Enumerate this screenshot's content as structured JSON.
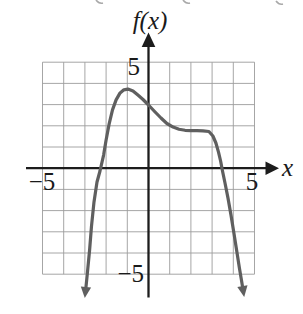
{
  "figure": {
    "function_label": "f(x)",
    "x_axis_label": "x",
    "ticks": {
      "y_top": "5",
      "y_bottom": "−5",
      "x_left": "−5",
      "x_right": "5"
    }
  },
  "colors": {
    "background": "#ffffff",
    "grid": "#9c9c9c",
    "axis": "#1c1c1c",
    "curve": "#5f5f5f",
    "text": "#1a1a1a",
    "fragment": "#a9a9a9"
  },
  "chart_data": {
    "type": "line",
    "title": "f(x)",
    "xlabel": "x",
    "ylabel": "f(x)",
    "xlim": [
      -5,
      5
    ],
    "ylim": [
      -5,
      5
    ],
    "grid": true,
    "grid_step": 1,
    "labeled_ticks": {
      "x": [
        -5,
        5
      ],
      "y": [
        -5,
        5
      ]
    },
    "series": [
      {
        "name": "f(x)",
        "end_arrows": "both curve ends have downward arrowheads below the grid",
        "points": [
          [
            -2.95,
            -5.6
          ],
          [
            -2.88,
            -4.94
          ],
          [
            -2.78,
            -3.86
          ],
          [
            -2.69,
            -2.73
          ],
          [
            -2.57,
            -1.59
          ],
          [
            -2.43,
            -0.65
          ],
          [
            -2.29,
            -0.13
          ],
          [
            -2.12,
            0.62
          ],
          [
            -2.0,
            1.33
          ],
          [
            -1.86,
            2.08
          ],
          [
            -1.7,
            2.75
          ],
          [
            -1.53,
            3.22
          ],
          [
            -1.34,
            3.55
          ],
          [
            -1.16,
            3.7
          ],
          [
            -0.97,
            3.73
          ],
          [
            -0.73,
            3.64
          ],
          [
            -0.5,
            3.45
          ],
          [
            -0.26,
            3.24
          ],
          [
            0.0,
            2.98
          ],
          [
            0.31,
            2.65
          ],
          [
            0.59,
            2.37
          ],
          [
            0.87,
            2.11
          ],
          [
            1.16,
            1.94
          ],
          [
            1.44,
            1.84
          ],
          [
            1.72,
            1.79
          ],
          [
            2.0,
            1.77
          ],
          [
            2.29,
            1.77
          ],
          [
            2.57,
            1.76
          ],
          [
            2.85,
            1.73
          ],
          [
            3.04,
            1.52
          ],
          [
            3.18,
            1.19
          ],
          [
            3.3,
            0.76
          ],
          [
            3.4,
            0.34
          ],
          [
            3.49,
            -0.13
          ],
          [
            3.61,
            -0.7
          ],
          [
            3.75,
            -1.41
          ],
          [
            3.89,
            -2.21
          ],
          [
            4.03,
            -3.06
          ],
          [
            4.17,
            -3.95
          ],
          [
            4.29,
            -4.71
          ],
          [
            4.39,
            -5.32
          ],
          [
            4.43,
            -5.56
          ]
        ]
      }
    ],
    "features": {
      "local_maximum": [
        -1,
        3.7
      ],
      "y_intercept": [
        0,
        3.0
      ],
      "x_intercepts": [
        -2.3,
        3.45
      ],
      "terrace_plateau": "nearly flat at y ≈ 1.8 for 1.5 ≤ x ≤ 2.9",
      "end_behavior": "curve plunges downward (arrows) near x ≈ -3 and x ≈ 4.4"
    }
  }
}
